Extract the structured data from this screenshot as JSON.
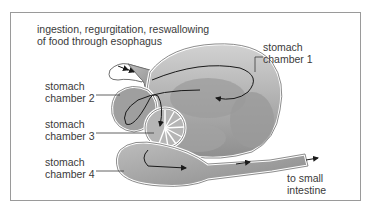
{
  "diagram": {
    "labels": {
      "top_line1": "ingestion, regurgitation, reswallowing",
      "top_line2": "of food through esophagus",
      "chamber1_line1": "stomach",
      "chamber1_line2": "chamber 1",
      "chamber2_line1": "stomach",
      "chamber2_line2": "chamber 2",
      "chamber3_line1": "stomach",
      "chamber3_line2": "chamber 3",
      "chamber4_line1": "stomach",
      "chamber4_line2": "chamber 4",
      "outlet_line1": "to small",
      "outlet_line2": "intestine"
    },
    "colors": {
      "frame": "#9a9a9a",
      "organ_fill": "#a9a9a9",
      "organ_light": "#c8c8c8",
      "organ_outline": "#6f6f6f",
      "arrow": "#1a1a1a",
      "text": "#3a3a3a"
    }
  }
}
